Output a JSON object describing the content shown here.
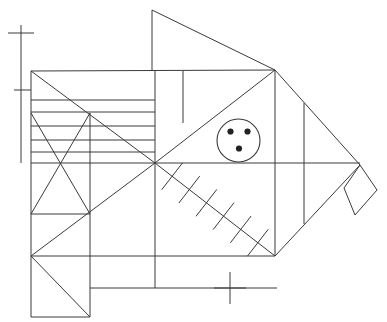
{
  "document": {
    "title": "Fish line drawing",
    "subject": "geometric fish figure composed of straight line segments",
    "background_color": "#ffffff",
    "stroke_color": "#3a3a3a",
    "dot_color": "#222222",
    "canvas": {
      "width": 387,
      "height": 322
    }
  },
  "figure": {
    "name": "fish",
    "parts": [
      {
        "id": "dorsal-fin",
        "label": "Dorsal fin (top triangle)"
      },
      {
        "id": "body",
        "label": "Body outline"
      },
      {
        "id": "tail",
        "label": "Tail fin (right)"
      },
      {
        "id": "tail-tip-diamond",
        "label": "Tail tip diamond"
      },
      {
        "id": "eye",
        "label": "Eye circle with three dots"
      },
      {
        "id": "spine-ribs",
        "label": "Diagonal spine with six ribs"
      },
      {
        "id": "stripes",
        "label": "Horizontal stripe band"
      },
      {
        "id": "x-box",
        "label": "Crossed rectangle (left)"
      },
      {
        "id": "lower-box",
        "label": "Lower-left box with diagonal"
      },
      {
        "id": "ruler-left",
        "label": "Left vertical ruler with two ticks"
      },
      {
        "id": "cross-mark-bottom",
        "label": "Bottom cross mark"
      }
    ]
  },
  "geometry": {
    "dorsal_fin": {
      "apex": [
        152,
        10
      ],
      "base_left": [
        152,
        71
      ],
      "base_right": [
        275,
        70
      ]
    },
    "body": {
      "top_left": [
        31,
        71
      ],
      "top_right": [
        275,
        70
      ],
      "snout_left": [
        31,
        256
      ],
      "mid_left": [
        155,
        163
      ],
      "bottom_right": [
        275,
        256
      ],
      "tail_tip": [
        360,
        165
      ]
    },
    "eye": {
      "center": [
        238.5,
        140.5
      ],
      "radius": 21.5,
      "dots": [
        [
          230.5,
          131.5
        ],
        [
          247.5,
          131.5
        ],
        [
          239,
          148.5
        ]
      ],
      "dot_radius": 3.1
    },
    "spine": {
      "from": [
        155,
        163
      ],
      "to": [
        275,
        256
      ],
      "rib_count": 6
    },
    "stripes": {
      "x_left": 31,
      "x_right": 155,
      "y_values": [
        85,
        100,
        112,
        126,
        140,
        152
      ]
    },
    "x_box": {
      "left": 31,
      "right": 90,
      "top": 113,
      "bottom": 214
    },
    "lower_box": {
      "left": 31,
      "right": 90,
      "top": 256,
      "bottom": 317
    },
    "ruler_left": {
      "x": 21,
      "y_top": 25,
      "y_bottom": 163,
      "tick_upper": {
        "y": 33,
        "x_from": 8,
        "x_to": 34
      },
      "tick_lower": {
        "y": 90,
        "x_from": 14,
        "x_to": 31
      }
    },
    "cross_mark_bottom": {
      "x": 230,
      "y": 288,
      "half_width": 16,
      "half_height": 16
    },
    "tail_diamond": {
      "top": [
        360,
        165
      ],
      "right": [
        377,
        190
      ],
      "bottom": [
        355,
        215
      ],
      "left": [
        344,
        188
      ]
    },
    "horizontal_midline": {
      "y": 163,
      "x_from": 31,
      "x_to": 360
    },
    "vertical_inner_lines": [
      {
        "x": 155,
        "y_from": 71,
        "y_to": 288
      },
      {
        "x": 183,
        "y_from": 71,
        "y_to": 123
      },
      {
        "x": 275,
        "y_from": 70,
        "y_to": 256
      },
      {
        "x": 304,
        "y_from": 103,
        "y_to": 224
      },
      {
        "x": 90,
        "y_from": 113,
        "y_to": 317
      }
    ],
    "lower_horizontals": [
      {
        "y": 256,
        "x_from": 31,
        "x_to": 275
      },
      {
        "y": 288,
        "x_from": 90,
        "x_to": 277
      }
    ]
  },
  "marks": {
    "ruler_label": "left scale ruler",
    "cross_label": "center cross mark",
    "dot_count": 3,
    "rib_count": 6,
    "stripe_count": 6
  }
}
